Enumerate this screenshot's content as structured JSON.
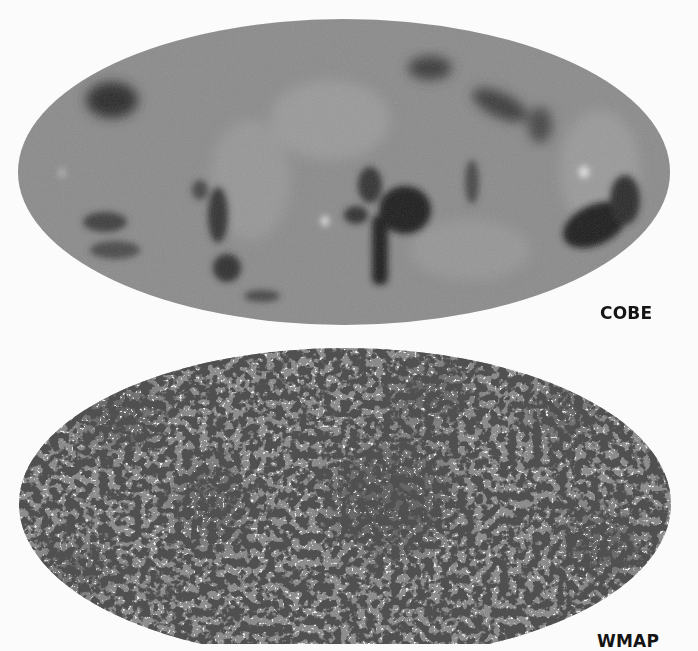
{
  "figure": {
    "panels": [
      {
        "id": "cobe",
        "label": "COBE",
        "description": "Mollweide all-sky CMB temperature map, low resolution, smooth blotches",
        "colors": {
          "base": "#8b8b8b",
          "dark": "#1c1c1c",
          "light": "#d8d8d8"
        }
      },
      {
        "id": "wmap",
        "label": "WMAP",
        "description": "Mollweide all-sky CMB temperature map, high resolution, fine speckled structure",
        "colors": {
          "base": "#8d8d8d",
          "dark": "#141414",
          "light": "#cfcfcf"
        }
      }
    ],
    "background": "#fbfbfb"
  }
}
